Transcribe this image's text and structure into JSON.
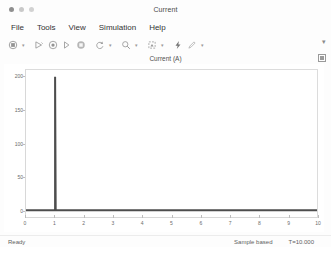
{
  "window": {
    "title": "Current",
    "controls": [
      {
        "name": "close",
        "color": "#8f8f8f"
      },
      {
        "name": "minimize",
        "color": "#c9c9c9"
      },
      {
        "name": "maximize",
        "color": "#d2d2d2"
      }
    ]
  },
  "menubar": {
    "items": [
      {
        "label": "File"
      },
      {
        "label": "Tools"
      },
      {
        "label": "View"
      },
      {
        "label": "Simulation"
      },
      {
        "label": "Help"
      }
    ]
  },
  "toolbar": {
    "overflow_label": "▾",
    "buttons": [
      {
        "icon": "print-icon",
        "has_caret": true
      },
      {
        "icon": "run-icon",
        "has_caret": false
      },
      {
        "icon": "record-icon",
        "has_caret": false
      },
      {
        "icon": "step-forward-icon",
        "has_caret": false
      },
      {
        "icon": "stop-icon",
        "has_caret": false
      },
      {
        "icon": "refresh-icon",
        "has_caret": true
      },
      {
        "icon": "zoom-icon",
        "has_caret": true
      },
      {
        "icon": "fit-to-view-icon",
        "has_caret": true
      },
      {
        "icon": "measurements-icon",
        "has_caret": false
      },
      {
        "icon": "annotation-icon",
        "has_caret": true
      }
    ]
  },
  "plot": {
    "title": "Current (A)",
    "legend_button": "legend-toggle-icon"
  },
  "statusbar": {
    "ready": "Ready",
    "mode": "Sample based",
    "time": "T=10.000"
  },
  "chart_data": {
    "type": "line",
    "title": "Current (A)",
    "xlabel": "",
    "ylabel": "",
    "xlim": [
      0,
      10
    ],
    "ylim": [
      -10,
      210
    ],
    "xticks": [
      0,
      1,
      2,
      3,
      4,
      5,
      6,
      7,
      8,
      9,
      10
    ],
    "xtick_labels": [
      "0",
      "1",
      "2",
      "3",
      "4",
      "5",
      "6",
      "7",
      "8",
      "9",
      "10"
    ],
    "yticks": [
      0,
      50,
      100,
      150,
      200
    ],
    "ytick_labels": [
      "0",
      "50",
      "100",
      "150",
      "200"
    ],
    "grid": false,
    "legend": false,
    "series": [
      {
        "name": "Current",
        "color": "#4d4d4d",
        "x": [
          0,
          0.98,
          1.0,
          1.0,
          1.02,
          1.05,
          10
        ],
        "y": [
          0,
          0,
          0,
          200,
          0,
          0,
          0
        ]
      }
    ]
  }
}
